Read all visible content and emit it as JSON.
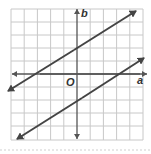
{
  "figure": {
    "axis_labels": {
      "x": "a",
      "y": "b",
      "origin": "O"
    },
    "grid": {
      "cols": 10,
      "rows": 10,
      "x_range": [
        -5,
        5
      ],
      "y_range": [
        -5,
        5
      ]
    },
    "colors": {
      "grid": "#c8c8c8",
      "axis": "#555555",
      "line": "#444444",
      "frame": "#bdbdbd",
      "separator": "#cfcfcf"
    },
    "lines": [
      {
        "name": "upper-line",
        "slope": "2/3",
        "b_intercept": 2,
        "a_intercept": -3
      },
      {
        "name": "lower-line",
        "slope": "2/3",
        "b_intercept": -2,
        "a_intercept": 3
      }
    ]
  }
}
